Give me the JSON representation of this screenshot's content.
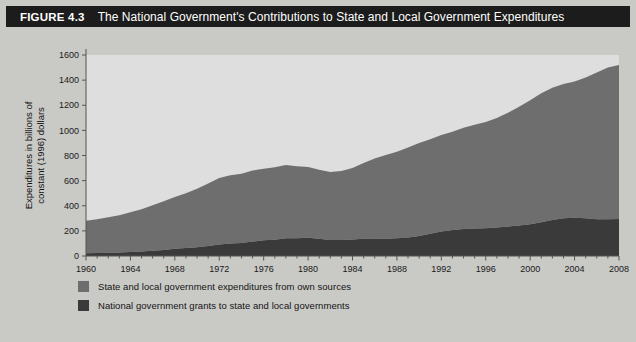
{
  "figure": {
    "number": "FIGURE 4.3",
    "title": "The National Government's Contributions to State and Local Government Expenditures"
  },
  "colors": {
    "panel_background": "#c9c9c6",
    "plot_background": "#dedede",
    "title_bar": "#1c1c1c",
    "title_text": "#ffffff",
    "own_sources": "#6e6e6e",
    "national_grants": "#3a3a3a",
    "axis": "#555555"
  },
  "legend": {
    "position": "below-plot",
    "items": [
      {
        "label": "State and local government expenditures from own sources",
        "color": "#6e6e6e",
        "series": "own_sources"
      },
      {
        "label": "National government grants to state and local governments",
        "color": "#3a3a3a",
        "series": "national_grants"
      }
    ]
  },
  "chart_data": {
    "type": "area",
    "stacked": true,
    "title": "The National Government's Contributions to State and Local Government Expenditures",
    "xlabel": "Year",
    "ylabel": "Expenditures in billions of constant (1996) dollars",
    "xlim": [
      1960,
      2008
    ],
    "ylim": [
      0,
      1600
    ],
    "yticks": [
      0,
      200,
      400,
      600,
      800,
      1000,
      1200,
      1400,
      1600
    ],
    "ytick_labels": [
      "0",
      "200",
      "400",
      "600",
      "800",
      "1000",
      "1200",
      "1400",
      "1600"
    ],
    "xticks": [
      1960,
      1964,
      1968,
      1972,
      1976,
      1980,
      1984,
      1988,
      1992,
      1996,
      2000,
      2004,
      2008
    ],
    "xtick_labels": [
      "1960",
      "1964",
      "1968",
      "1972",
      "1976",
      "1980",
      "1984",
      "1988",
      "1992",
      "1996",
      "2000",
      "2004",
      "2008"
    ],
    "minor_xtick_interval": 1,
    "grid": false,
    "x": [
      1960,
      1961,
      1962,
      1963,
      1964,
      1965,
      1966,
      1967,
      1968,
      1969,
      1970,
      1971,
      1972,
      1973,
      1974,
      1975,
      1976,
      1977,
      1978,
      1979,
      1980,
      1981,
      1982,
      1983,
      1984,
      1985,
      1986,
      1987,
      1988,
      1989,
      1990,
      1991,
      1992,
      1993,
      1994,
      1995,
      1996,
      1997,
      1998,
      1999,
      2000,
      2001,
      2002,
      2003,
      2004,
      2005,
      2006,
      2007,
      2008
    ],
    "series": [
      {
        "name": "National government grants to state and local governments",
        "color": "#3a3a3a",
        "values": [
          22,
          24,
          26,
          28,
          31,
          35,
          42,
          48,
          57,
          63,
          70,
          80,
          92,
          100,
          104,
          115,
          125,
          130,
          142,
          142,
          145,
          138,
          128,
          128,
          132,
          138,
          140,
          138,
          142,
          148,
          160,
          178,
          196,
          206,
          214,
          219,
          220,
          226,
          234,
          243,
          252,
          268,
          286,
          300,
          305,
          300,
          292,
          292,
          295
        ]
      },
      {
        "name": "State and local government expenditures from own sources",
        "color": "#6e6e6e",
        "values": [
          258,
          268,
          282,
          296,
          317,
          337,
          362,
          388,
          413,
          437,
          466,
          498,
          528,
          543,
          551,
          565,
          570,
          577,
          583,
          573,
          563,
          548,
          540,
          548,
          568,
          602,
          637,
          665,
          688,
          715,
          740,
          752,
          768,
          784,
          806,
          826,
          846,
          872,
          906,
          946,
          988,
          1028,
          1054,
          1070,
          1085,
          1120,
          1168,
          1208,
          1225
        ]
      }
    ],
    "totals_note": "Values are the stacked band thicknesses in billions of constant (1996) dollars; the top of the stack rises from about 280 in 1960 to about 1520 in 2008."
  }
}
